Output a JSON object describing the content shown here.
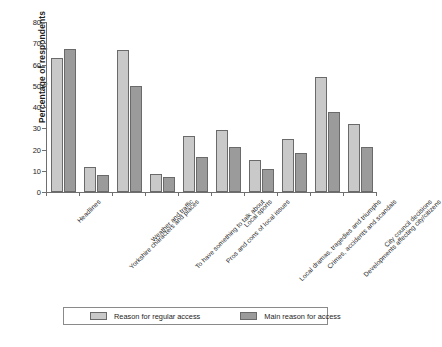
{
  "chart_data": {
    "type": "bar",
    "title": "",
    "xlabel": "",
    "ylabel": "Percentage of respondents",
    "ylim": [
      0,
      80
    ],
    "ytick_step": 10,
    "yticks": [
      0,
      10,
      20,
      30,
      40,
      50,
      60,
      70,
      80
    ],
    "grid": false,
    "legend_position": "bottom",
    "categories": [
      "Headlines",
      "Yorkshire characters and places",
      "Weather and traffic",
      "To have something to talk about",
      "Pros and cons of local issues",
      "Local sports",
      "Local dramas, tragedies and triumphs",
      "Crimes, accidents and scandals",
      "Developments affecting city/citizens",
      "City council decisions"
    ],
    "series": [
      {
        "name": "Reason for regular access",
        "color": "#c9c9c9",
        "values": [
          63,
          12,
          67,
          8.5,
          26.5,
          29,
          15,
          25,
          54,
          32
        ]
      },
      {
        "name": "Main reason for access",
        "color": "#9b9b9b",
        "values": [
          67.5,
          8,
          50,
          7,
          16.5,
          21,
          11,
          18.5,
          37.5,
          21
        ]
      }
    ]
  },
  "legend": {
    "items": [
      {
        "label": "Reason for regular access",
        "swatch": "light"
      },
      {
        "label": "Main reason for access",
        "swatch": "dark"
      }
    ]
  },
  "axis": {
    "y_title": "Percentage of respondents"
  },
  "caption_fragment": ""
}
